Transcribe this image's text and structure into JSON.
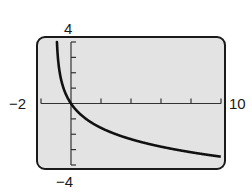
{
  "chart_data": {
    "type": "line",
    "title": "",
    "xlabel": "",
    "ylabel": "",
    "xlim": [
      -2,
      10
    ],
    "ylim": [
      -4,
      4
    ],
    "x_tick_step": 2,
    "y_tick_step": 1,
    "grid": false,
    "legend": null,
    "window_labels": {
      "xmin": "−2",
      "xmax": "10",
      "ymin": "−4",
      "ymax": "4"
    },
    "series": [
      {
        "name": "f(x) = -log2(x+1)",
        "x": [
          -0.9375,
          -0.875,
          -0.75,
          -0.5,
          0,
          1,
          2,
          3,
          4,
          5,
          6,
          7,
          8,
          9,
          10
        ],
        "y": [
          4,
          3,
          2,
          1,
          0,
          -1,
          -1.58,
          -2,
          -2.32,
          -2.58,
          -2.81,
          -3,
          -3.17,
          -3.32,
          -3.46
        ]
      }
    ],
    "colors": {
      "curve": "#111111",
      "screen_background": "#e3e3e3",
      "screen_border": "#1a1a1a",
      "axes": "#333333"
    }
  }
}
